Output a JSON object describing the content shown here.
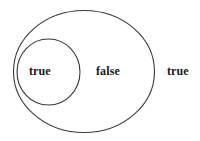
{
  "diagram": {
    "type": "euler-venn-diagram",
    "background_color": "#ffffff",
    "stroke_color": "#3a3a3a",
    "text_color": "#1a1a1a",
    "shapes": {
      "outer_ellipse": {
        "name": "outer-ellipse",
        "cx": 84,
        "cy": 71.5,
        "rx": 70.5,
        "ry": 61
      },
      "inner_circle": {
        "name": "inner-circle",
        "cx": 48.5,
        "cy": 72,
        "rx": 31.5,
        "ry": 33
      }
    },
    "labels": {
      "inner": "true",
      "middle": "false",
      "outside": "true"
    }
  }
}
